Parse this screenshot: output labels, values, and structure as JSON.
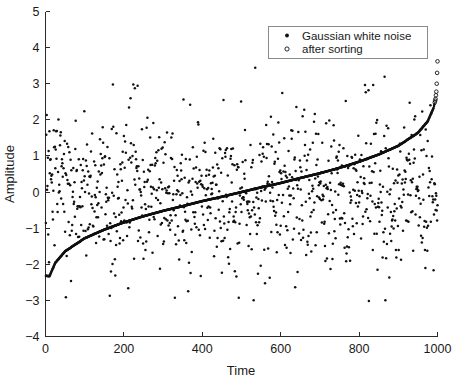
{
  "chart_data": {
    "type": "scatter",
    "title": "",
    "xlabel": "Time",
    "ylabel": "Amplitude",
    "xlim": [
      0,
      1000
    ],
    "ylim": [
      -4,
      5
    ],
    "xticks": [
      0,
      200,
      400,
      600,
      800,
      1000
    ],
    "yticks": [
      -4,
      -3,
      -2,
      -1,
      0,
      1,
      2,
      3,
      4,
      5
    ],
    "xtick_labels": [
      "0",
      "200",
      "400",
      "600",
      "800",
      "1000"
    ],
    "ytick_labels": [
      "-4",
      "-3",
      "-2",
      "-1",
      "0",
      "1",
      "2",
      "3",
      "4",
      "5"
    ],
    "grid": false,
    "legend_position": "upper-right",
    "legend": [
      {
        "label": "Gaussian white noise",
        "marker": "filled-dot"
      },
      {
        "label": "after sorting",
        "marker": "open-circle"
      }
    ],
    "series": [
      {
        "name": "Gaussian white noise",
        "marker": "filled-dot",
        "color": "#111111",
        "n_points": 1000,
        "distribution": "normal",
        "mean": 0,
        "std": 1,
        "note": "unsorted samples, x = index 1..1000",
        "extremes": [
          {
            "x": 535,
            "y": 3.62
          },
          {
            "x": 535,
            "y": 3.44
          },
          {
            "x": 865,
            "y": 3.19
          },
          {
            "x": 172,
            "y": 2.98
          },
          {
            "x": 825,
            "y": -3.02
          },
          {
            "x": 65,
            "y": -2.46
          },
          {
            "x": 487,
            "y": -2.34
          },
          {
            "x": 178,
            "y": -2.31
          },
          {
            "x": 572,
            "y": -2.37
          }
        ]
      },
      {
        "name": "after sorting",
        "marker": "open-circle",
        "color": "#111111",
        "n_points": 1000,
        "note": "same 1000 samples sorted ascending; traces the normal quantile function",
        "y_start": -2.32,
        "y_end": 3.62,
        "quantile_anchors": [
          {
            "x": 1,
            "y": -2.32
          },
          {
            "x": 10,
            "y": -2.33
          },
          {
            "x": 25,
            "y": -1.96
          },
          {
            "x": 50,
            "y": -1.64
          },
          {
            "x": 100,
            "y": -1.28
          },
          {
            "x": 150,
            "y": -1.04
          },
          {
            "x": 200,
            "y": -0.84
          },
          {
            "x": 250,
            "y": -0.67
          },
          {
            "x": 300,
            "y": -0.52
          },
          {
            "x": 350,
            "y": -0.39
          },
          {
            "x": 400,
            "y": -0.25
          },
          {
            "x": 450,
            "y": -0.13
          },
          {
            "x": 500,
            "y": 0.0
          },
          {
            "x": 550,
            "y": 0.13
          },
          {
            "x": 600,
            "y": 0.25
          },
          {
            "x": 650,
            "y": 0.39
          },
          {
            "x": 700,
            "y": 0.52
          },
          {
            "x": 750,
            "y": 0.67
          },
          {
            "x": 800,
            "y": 0.84
          },
          {
            "x": 850,
            "y": 1.04
          },
          {
            "x": 900,
            "y": 1.28
          },
          {
            "x": 950,
            "y": 1.64
          },
          {
            "x": 975,
            "y": 1.96
          },
          {
            "x": 990,
            "y": 2.33
          },
          {
            "x": 995,
            "y": 2.58
          },
          {
            "x": 997,
            "y": 2.78
          },
          {
            "x": 998,
            "y": 3.0
          },
          {
            "x": 999,
            "y": 3.3
          },
          {
            "x": 1000,
            "y": 3.62
          }
        ]
      }
    ]
  },
  "axes": {
    "x_title": "Time",
    "y_title": "Amplitude"
  }
}
